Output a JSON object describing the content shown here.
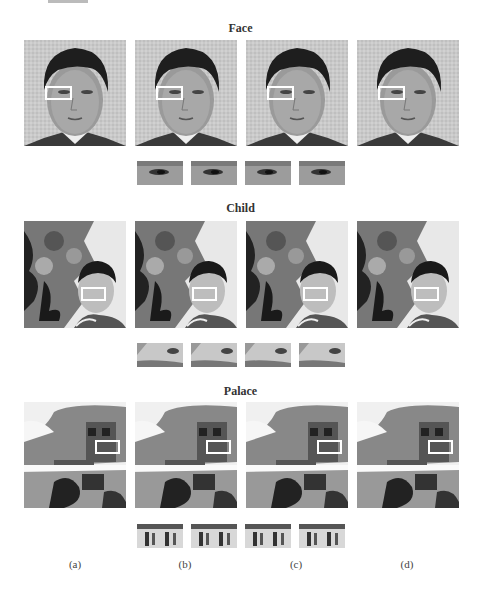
{
  "figure": {
    "sections": [
      {
        "title": "Face",
        "subject": "face"
      },
      {
        "title": "Child",
        "subject": "child"
      },
      {
        "title": "Palace",
        "subject": "palace"
      }
    ],
    "column_labels": [
      "(a)",
      "(b)",
      "(c)",
      "(d)"
    ],
    "colors": {
      "highlight_box": "#ffffff",
      "background": "#ffffff",
      "text": "#333333"
    }
  }
}
